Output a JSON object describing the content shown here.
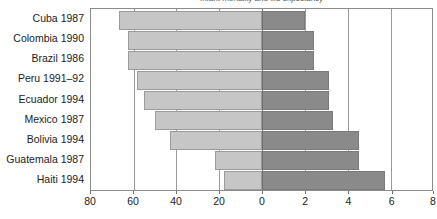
{
  "chart_data": {
    "type": "bar",
    "orientation": "horizontal",
    "title": "Infant mortality and life expectancy",
    "categories": [
      "Cuba 1987",
      "Colombia 1990",
      "Brazil 1986",
      "Peru 1991–92",
      "Ecuador 1994",
      "Mexico 1987",
      "Bolivia 1994",
      "Guatemala 1987",
      "Haiti 1994"
    ],
    "series": [
      {
        "name": "left",
        "axis": "left",
        "color": "#c6c6c6",
        "values": [
          67,
          65,
          65,
          58,
          55,
          50,
          43,
          22,
          18
        ]
      },
      {
        "name": "right",
        "axis": "right",
        "color": "#8a8a8a",
        "values": [
          2.0,
          2.4,
          2.4,
          3.1,
          3.1,
          3.3,
          4.5,
          4.5,
          5.7
        ]
      }
    ],
    "left_axis": {
      "ticks": [
        80,
        60,
        40,
        20,
        0
      ],
      "tick_labels": [
        "80",
        "60",
        "40",
        "20",
        "0"
      ],
      "min": 0,
      "max": 80,
      "direction": "reversed"
    },
    "right_axis": {
      "ticks": [
        0,
        2,
        4,
        6,
        8
      ],
      "tick_labels": [
        "0",
        "2",
        "4",
        "6",
        "8"
      ],
      "min": 0,
      "max": 8,
      "direction": "normal"
    },
    "xlabel": "",
    "ylabel": "",
    "grid": true,
    "legend": "none"
  },
  "axis_ticks": [
    {
      "label": "80",
      "x_pct": 0.0
    },
    {
      "label": "60",
      "x_pct": 12.536
    },
    {
      "label": "40",
      "x_pct": 25.073
    },
    {
      "label": "20",
      "x_pct": 37.609
    },
    {
      "label": "0",
      "x_pct": 50.146
    },
    {
      "label": "2",
      "x_pct": 62.755
    },
    {
      "label": "4",
      "x_pct": 75.364
    },
    {
      "label": "6",
      "x_pct": 87.973
    },
    {
      "label": "8",
      "x_pct": 100.0
    }
  ],
  "rows": [
    {
      "label": "Cuba 1987",
      "left_start_pct": 8.16,
      "left_width_pct": 41.99,
      "right_width_pct": 12.61
    },
    {
      "label": "Colombia 1990",
      "left_start_pct": 10.82,
      "left_width_pct": 39.33,
      "right_width_pct": 15.13
    },
    {
      "label": "Brazil 1986",
      "left_start_pct": 10.82,
      "left_width_pct": 39.33,
      "right_width_pct": 15.13
    },
    {
      "label": "Peru 1991–92",
      "left_start_pct": 13.61,
      "left_width_pct": 36.54,
      "right_width_pct": 19.54
    },
    {
      "label": "Ecuador 1994",
      "left_start_pct": 15.68,
      "left_width_pct": 34.47,
      "right_width_pct": 19.54
    },
    {
      "label": "Mexico 1987",
      "left_start_pct": 18.81,
      "left_width_pct": 31.34,
      "right_width_pct": 20.8
    },
    {
      "label": "Bolivia 1994",
      "left_start_pct": 23.19,
      "left_width_pct": 26.96,
      "right_width_pct": 28.37
    },
    {
      "label": "Guatemala 1987",
      "left_start_pct": 36.36,
      "left_width_pct": 13.79,
      "right_width_pct": 28.37
    },
    {
      "label": "Haiti 1994",
      "left_start_pct": 38.86,
      "left_width_pct": 11.29,
      "right_width_pct": 35.93
    }
  ]
}
